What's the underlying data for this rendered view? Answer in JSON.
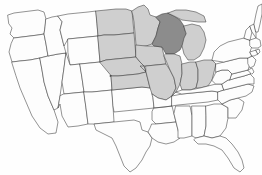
{
  "figure": {
    "name": "united-states-map",
    "type": "choropleth-map",
    "background_color": "#fefefe",
    "border_color": "#3a3a3a",
    "width": 262,
    "height": 175
  },
  "legend": {
    "visible": false,
    "categories": [
      {
        "key": "focus",
        "label": "Highlighted state",
        "color": "#8c8c8c"
      },
      {
        "key": "region",
        "label": "Region states",
        "color": "#cfcfcf"
      },
      {
        "key": "none",
        "label": "Other states",
        "color": "#fdfdfd"
      }
    ]
  },
  "map_data": {
    "type": "choropleth",
    "projection": "albers-usa",
    "focus_state": "Wisconsin",
    "region_name": "Midwest",
    "shaded_count": 12,
    "states": [
      {
        "code": "WA",
        "name": "Washington",
        "shade": "none",
        "label": ""
      },
      {
        "code": "OR",
        "name": "Oregon",
        "shade": "none",
        "label": ""
      },
      {
        "code": "CA",
        "name": "California",
        "shade": "none",
        "label": ""
      },
      {
        "code": "NV",
        "name": "Nevada",
        "shade": "none",
        "label": ""
      },
      {
        "code": "ID",
        "name": "Idaho",
        "shade": "none",
        "label": ""
      },
      {
        "code": "MT",
        "name": "Montana",
        "shade": "none",
        "label": ""
      },
      {
        "code": "WY",
        "name": "Wyoming",
        "shade": "none",
        "label": ""
      },
      {
        "code": "UT",
        "name": "Utah",
        "shade": "none",
        "label": ""
      },
      {
        "code": "AZ",
        "name": "Arizona",
        "shade": "none",
        "label": ""
      },
      {
        "code": "CO",
        "name": "Colorado",
        "shade": "none",
        "label": ""
      },
      {
        "code": "NM",
        "name": "New Mexico",
        "shade": "none",
        "label": ""
      },
      {
        "code": "TX",
        "name": "Texas",
        "shade": "none",
        "label": ""
      },
      {
        "code": "OK",
        "name": "Oklahoma",
        "shade": "none",
        "label": ""
      },
      {
        "code": "ND",
        "name": "North Dakota",
        "shade": "region",
        "label": ""
      },
      {
        "code": "SD",
        "name": "South Dakota",
        "shade": "region",
        "label": ""
      },
      {
        "code": "NE",
        "name": "Nebraska",
        "shade": "region",
        "label": ""
      },
      {
        "code": "KS",
        "name": "Kansas",
        "shade": "region",
        "label": ""
      },
      {
        "code": "MN",
        "name": "Minnesota",
        "shade": "region",
        "label": ""
      },
      {
        "code": "IA",
        "name": "Iowa",
        "shade": "region",
        "label": ""
      },
      {
        "code": "MO",
        "name": "Missouri",
        "shade": "region",
        "label": ""
      },
      {
        "code": "WI",
        "name": "Wisconsin",
        "shade": "focus",
        "label": ""
      },
      {
        "code": "IL",
        "name": "Illinois",
        "shade": "region",
        "label": ""
      },
      {
        "code": "IN",
        "name": "Indiana",
        "shade": "region",
        "label": ""
      },
      {
        "code": "OH",
        "name": "Ohio",
        "shade": "region",
        "label": ""
      },
      {
        "code": "MI",
        "name": "Michigan",
        "shade": "region",
        "label": ""
      },
      {
        "code": "AR",
        "name": "Arkansas",
        "shade": "none",
        "label": ""
      },
      {
        "code": "LA",
        "name": "Louisiana",
        "shade": "none",
        "label": ""
      },
      {
        "code": "MS",
        "name": "Mississippi",
        "shade": "none",
        "label": ""
      },
      {
        "code": "AL",
        "name": "Alabama",
        "shade": "none",
        "label": ""
      },
      {
        "code": "TN",
        "name": "Tennessee",
        "shade": "none",
        "label": ""
      },
      {
        "code": "KY",
        "name": "Kentucky",
        "shade": "none",
        "label": ""
      },
      {
        "code": "GA",
        "name": "Georgia",
        "shade": "none",
        "label": ""
      },
      {
        "code": "FL",
        "name": "Florida",
        "shade": "none",
        "label": ""
      },
      {
        "code": "SC",
        "name": "South Carolina",
        "shade": "none",
        "label": ""
      },
      {
        "code": "NC",
        "name": "North Carolina",
        "shade": "none",
        "label": ""
      },
      {
        "code": "VA",
        "name": "Virginia",
        "shade": "none",
        "label": ""
      },
      {
        "code": "WV",
        "name": "West Virginia",
        "shade": "none",
        "label": ""
      },
      {
        "code": "MD",
        "name": "Maryland",
        "shade": "none",
        "label": ""
      },
      {
        "code": "DE",
        "name": "Delaware",
        "shade": "none",
        "label": ""
      },
      {
        "code": "PA",
        "name": "Pennsylvania",
        "shade": "none",
        "label": ""
      },
      {
        "code": "NJ",
        "name": "New Jersey",
        "shade": "none",
        "label": ""
      },
      {
        "code": "NY",
        "name": "New York",
        "shade": "none",
        "label": ""
      },
      {
        "code": "CT",
        "name": "Connecticut",
        "shade": "none",
        "label": ""
      },
      {
        "code": "RI",
        "name": "Rhode Island",
        "shade": "none",
        "label": ""
      },
      {
        "code": "MA",
        "name": "Massachusetts",
        "shade": "none",
        "label": ""
      },
      {
        "code": "VT",
        "name": "Vermont",
        "shade": "none",
        "label": ""
      },
      {
        "code": "NH",
        "name": "New Hampshire",
        "shade": "none",
        "label": ""
      },
      {
        "code": "ME",
        "name": "Maine",
        "shade": "none",
        "label": ""
      }
    ]
  }
}
